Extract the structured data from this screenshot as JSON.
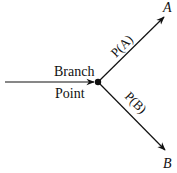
{
  "diagram": {
    "branch_label_line1": "Branch",
    "branch_label_line2": "Point",
    "edge_upper_label": "P(A)",
    "edge_lower_label": "P(B)",
    "node_upper": "A",
    "node_lower": "B",
    "stroke_color": "#111111"
  }
}
